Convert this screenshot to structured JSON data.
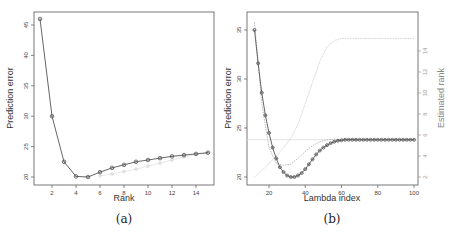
{
  "chart_data": [
    {
      "type": "line",
      "panel": "(a)",
      "xlabel": "Rank",
      "ylabel": "Prediction error",
      "xlim": [
        0.5,
        15.5
      ],
      "ylim": [
        19,
        47
      ],
      "xticks": [
        2,
        4,
        6,
        8,
        10,
        12,
        14
      ],
      "yticks": [
        20,
        25,
        30,
        35,
        40,
        45
      ],
      "grid": false,
      "series": [
        {
          "name": "prediction error",
          "color": "#555555",
          "x": [
            1,
            2,
            3,
            4,
            5,
            6,
            7,
            8,
            9,
            10,
            11,
            12,
            13,
            14,
            15
          ],
          "values": [
            46.0,
            30.0,
            22.5,
            20.1,
            20.0,
            20.8,
            21.5,
            22.0,
            22.5,
            22.8,
            23.1,
            23.4,
            23.6,
            23.8,
            24.0
          ]
        },
        {
          "name": "faint series",
          "color": "#d8d8d8",
          "x": [
            6,
            7,
            8,
            9,
            10,
            11,
            12,
            13,
            14,
            15
          ],
          "values": [
            20.2,
            20.5,
            20.9,
            21.3,
            21.8,
            22.3,
            22.8,
            23.3,
            23.7,
            24.0
          ]
        }
      ]
    },
    {
      "type": "line",
      "panel": "(b)",
      "xlabel": "Lambda index",
      "ylabel": "Prediction error",
      "ylabel_right": "Estimated rank",
      "xlim": [
        8,
        102
      ],
      "ylim": [
        19.3,
        35.8
      ],
      "ylim_right": [
        1.5,
        15.5
      ],
      "xticks": [
        20,
        40,
        60,
        80,
        100
      ],
      "yticks": [
        20,
        25,
        30,
        35
      ],
      "yticks_right": [
        2,
        4,
        6,
        8,
        10,
        12,
        14
      ],
      "grid": false,
      "hline": 23.8,
      "series": [
        {
          "name": "prediction error",
          "color": "#555555",
          "x": [
            12,
            14,
            16,
            18,
            20,
            22,
            24,
            26,
            28,
            30,
            32,
            34,
            36,
            38,
            40,
            42,
            44,
            46,
            48,
            50,
            52,
            54,
            56,
            58,
            60,
            62,
            64,
            66,
            68,
            70,
            72,
            74,
            76,
            78,
            80,
            82,
            84,
            86,
            88,
            90,
            92,
            94,
            96,
            98,
            100
          ],
          "values": [
            35.0,
            31.6,
            28.6,
            26.3,
            24.5,
            23.0,
            21.9,
            21.0,
            20.5,
            20.15,
            20.0,
            20.0,
            20.15,
            20.4,
            20.8,
            21.3,
            21.8,
            22.3,
            22.7,
            23.0,
            23.25,
            23.45,
            23.6,
            23.7,
            23.75,
            23.8,
            23.8,
            23.8,
            23.8,
            23.8,
            23.8,
            23.8,
            23.8,
            23.8,
            23.8,
            23.8,
            23.8,
            23.8,
            23.8,
            23.8,
            23.8,
            23.8,
            23.8,
            23.8,
            23.8
          ]
        },
        {
          "name": "secondary error (faint)",
          "color": "#bbbbbb",
          "x": [
            12,
            16,
            20,
            24,
            28,
            32,
            36,
            40,
            44,
            48,
            52,
            56,
            60,
            64,
            68
          ],
          "values": [
            35.8,
            27.5,
            23.0,
            21.4,
            21.2,
            21.3,
            21.9,
            22.6,
            23.2,
            23.6,
            23.8,
            23.85,
            23.85,
            23.85,
            23.85
          ]
        },
        {
          "name": "estimated rank",
          "color": "#cccccc",
          "axis": "right",
          "x": [
            12,
            16,
            20,
            24,
            28,
            32,
            36,
            40,
            44,
            48,
            52,
            56,
            60,
            64,
            70,
            80,
            90,
            100
          ],
          "values": [
            2.0,
            2.6,
            3.3,
            4.0,
            4.8,
            5.7,
            7.0,
            9.0,
            11.0,
            13.0,
            14.4,
            15.0,
            15.2,
            15.2,
            15.2,
            15.2,
            15.2,
            15.2
          ]
        }
      ]
    }
  ],
  "captions": {
    "a": "(a)",
    "b": "(b)"
  },
  "labels": {
    "a": {
      "x": "Rank",
      "y": "Prediction error",
      "xticks": [
        "2",
        "4",
        "6",
        "8",
        "10",
        "12",
        "14"
      ],
      "yticks": [
        "20",
        "25",
        "30",
        "35",
        "40",
        "45"
      ]
    },
    "b": {
      "x": "Lambda index",
      "y": "Prediction error",
      "y2": "Estimated rank",
      "xticks": [
        "20",
        "40",
        "60",
        "80",
        "100"
      ],
      "yticks": [
        "20",
        "25",
        "30",
        "35"
      ],
      "y2ticks": [
        "2",
        "4",
        "6",
        "8",
        "10",
        "12",
        "14"
      ]
    }
  }
}
